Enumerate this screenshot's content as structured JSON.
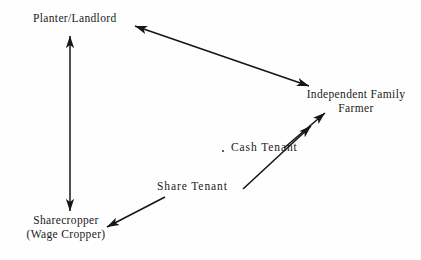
{
  "diagram": {
    "background_color": "#fefefe",
    "ink_color": "#1a1a1a",
    "nodes": [
      {
        "id": "planter-landlord",
        "lines": [
          "Planter/Landlord"
        ],
        "x": 33,
        "y": 12
      },
      {
        "id": "independent-family-farmer",
        "lines": [
          "Independent Family",
          "Farmer"
        ],
        "x": 299,
        "y": 88
      },
      {
        "id": "cash-tenant",
        "lines": [
          "Cash Tenant"
        ],
        "x": 231,
        "y": 141
      },
      {
        "id": "share-tenant",
        "lines": [
          "Share Tenant"
        ],
        "x": 157,
        "y": 180
      },
      {
        "id": "sharecropper",
        "lines": [
          "Sharecropper",
          "(Wage Cropper)"
        ],
        "x": 8,
        "y": 214
      }
    ],
    "edges": [
      {
        "id": "planter-sharecropper",
        "from": "planter-landlord",
        "to": "sharecropper",
        "direction": "both",
        "x1": 70,
        "y1": 36,
        "x2": 70,
        "y2": 211
      },
      {
        "id": "planter-independent-farmer",
        "from": "planter-landlord",
        "to": "independent-family-farmer",
        "direction": "both",
        "x1": 135,
        "y1": 26,
        "x2": 309,
        "y2": 86
      },
      {
        "id": "cash-tenant-independent-farmer",
        "from": "cash-tenant",
        "to": "independent-family-farmer",
        "direction": "forward",
        "x1": 284,
        "y1": 148,
        "x2": 325,
        "y2": 113
      },
      {
        "id": "share-tenant-upward",
        "from": "share-tenant",
        "to": "cash-tenant",
        "direction": "forward",
        "x1": 243,
        "y1": 189,
        "x2": 311,
        "y2": 126
      },
      {
        "id": "share-tenant-sharecropper",
        "from": "share-tenant",
        "to": "sharecropper",
        "direction": "forward",
        "x1": 165,
        "y1": 197,
        "x2": 107,
        "y2": 227
      }
    ]
  }
}
